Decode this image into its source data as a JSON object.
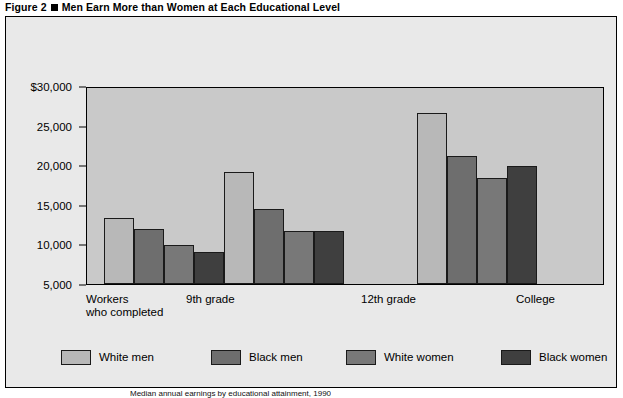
{
  "figure": {
    "label": "Figure 2",
    "title": "Men Earn More than Women at Each Educational Level",
    "bullet_icon": "square-bullet-icon"
  },
  "source_note": {
    "text": "Median annual earnings by educational attainment, 1990",
    "year": "1990"
  },
  "colors": {
    "panel_background": "#e9e9e9",
    "plot_background": "#c9c9c9",
    "axis_line": "#000000",
    "bar_outline": "#1a1a1a",
    "white_men": "#b8b8b8",
    "black_men": "#6e6e6e",
    "white_women": "#787878",
    "black_women": "#3f3f3f"
  },
  "chart_data": {
    "type": "bar",
    "title": "Men Earn More than Women at Each Educational Level",
    "xlabel": "Workers who completed",
    "ylabel": "",
    "categories": [
      "9th  grade",
      "12th  grade",
      "College"
    ],
    "category_prefix_label": "Workers\nwho completed",
    "ylim": [
      5000,
      30000
    ],
    "ytick_values": [
      30000,
      25000,
      20000,
      15000,
      10000,
      5000
    ],
    "ytick_labels": [
      "$30,000",
      "25,000",
      "20,000",
      "15,000",
      "10,000",
      "5,000"
    ],
    "grid": false,
    "legend_position": "bottom",
    "series": [
      {
        "name": "White men",
        "color": "#b8b8b8",
        "values": [
          13300,
          19100,
          26600
        ]
      },
      {
        "name": "Black men",
        "color": "#6e6e6e",
        "values": [
          11900,
          14500,
          21200
        ]
      },
      {
        "name": "White women",
        "color": "#787878",
        "values": [
          9900,
          11700,
          18400
        ]
      },
      {
        "name": "Black women",
        "color": "#3f3f3f",
        "values": [
          9000,
          11700,
          19900
        ]
      }
    ]
  },
  "axis": {
    "y_ticks": [
      {
        "label": "$30,000",
        "value": 30000
      },
      {
        "label": "25,000",
        "value": 25000
      },
      {
        "label": "20,000",
        "value": 20000
      },
      {
        "label": "15,000",
        "value": 15000
      },
      {
        "label": "10,000",
        "value": 10000
      },
      {
        "label": "5,000",
        "value": 5000
      }
    ]
  },
  "x_axis": {
    "prefix_line1": "Workers",
    "prefix_line2": "who completed",
    "labels": [
      "9th  grade",
      "12th  grade",
      "College"
    ]
  },
  "legend": {
    "items": [
      {
        "label": "White men",
        "color": "#b8b8b8"
      },
      {
        "label": "Black men",
        "color": "#6e6e6e"
      },
      {
        "label": "White women",
        "color": "#787878"
      },
      {
        "label": "Black women",
        "color": "#3f3f3f"
      }
    ]
  }
}
